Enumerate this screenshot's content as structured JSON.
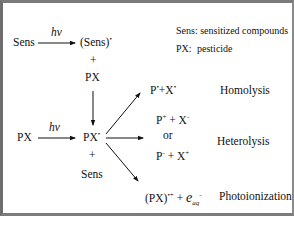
{
  "legend": {
    "line1": "Sens: sensitized compounds",
    "line2_key": "PX:",
    "line2_value": "pesticide"
  },
  "top_path": {
    "reactant": "Sens",
    "light": "hv",
    "product_base": "(Sens)",
    "product_sup": "•",
    "plus": "+",
    "partner": "PX"
  },
  "middle_path": {
    "reactant": "PX",
    "light": "hv",
    "excited_base": "PX",
    "excited_sup": "•",
    "plus": "+",
    "partner": "Sens"
  },
  "outcomes": {
    "homolysis": {
      "p_base": "P",
      "p_sup": "•",
      "plus": "+",
      "x_base": "X",
      "x_sup": "•",
      "label": "Homolysis"
    },
    "heterolysis": {
      "option1_p": "P",
      "option1_p_sup": "+",
      "option1_plus": " + ",
      "option1_x": "X",
      "option1_x_sup": "-",
      "or": "or",
      "option2_p": "P",
      "option2_p_sup": "-",
      "option2_plus": " + ",
      "option2_x": "X",
      "option2_x_sup": "+",
      "label": "Heterolysis"
    },
    "photoionization": {
      "radical_base": "(PX)",
      "radical_sup": "•+",
      "plus": " + ",
      "electron": "e",
      "electron_sub": "aq",
      "electron_sup": "-",
      "label": "Photoionization"
    }
  },
  "colors": {
    "frame": "#7a7a7a",
    "text": "#111111",
    "background": "#ffffff"
  }
}
